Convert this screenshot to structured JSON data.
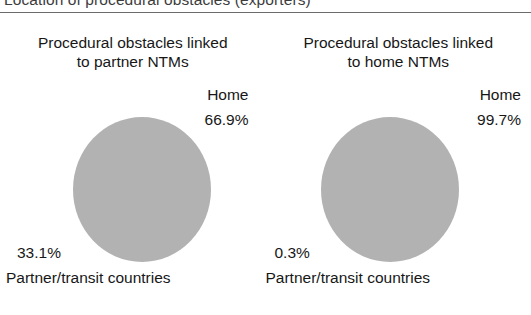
{
  "figure": {
    "caption": "Location of procedural obstacles (exporters)"
  },
  "chart_data": {
    "type": "pie",
    "title": "Location of procedural obstacles (exporters)",
    "grid": false,
    "legend_position": "none",
    "charts": [
      {
        "title": "Procedural obstacles linked\nto partner NTMs",
        "labels": [
          "Home",
          "Partner/transit countries"
        ],
        "values": [
          66.9,
          0
        ],
        "value_labels": [
          "66.9%",
          "33.1%"
        ],
        "slice_color": "#b2b2b2",
        "top_label": "Home",
        "top_value": "66.9%",
        "bottom_value": "33.1%",
        "bottom_label": "Partner/transit countries"
      },
      {
        "title": "Procedural obstacles linked\nto home NTMs",
        "labels": [
          "Home",
          "Partner/transit countries"
        ],
        "values": [
          99.7,
          0.3
        ],
        "value_labels": [
          "99.7%",
          "0.3%"
        ],
        "slice_color": "#b2b2b2",
        "top_label": "Home",
        "top_value": "99.7%",
        "bottom_value": "0.3%",
        "bottom_label": "Partner/transit countries"
      }
    ]
  }
}
